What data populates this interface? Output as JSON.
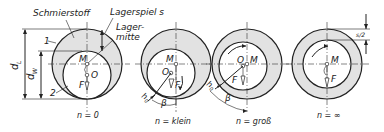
{
  "diagram": {
    "type": "plain-bearing-shaft-positions",
    "colors": {
      "lubricant": "#e2e2e2",
      "line": "#222222",
      "background": "#ffffff"
    },
    "labels": {
      "lubricant": "Schmierstoff",
      "clearance": "Lagerspiel s",
      "bearing_center": "Lager-\nmitte",
      "bearing_center_line1": "Lager-",
      "bearing_center_line2": "mitte",
      "d_bearing": "d",
      "d_bearing_sub": "L",
      "d_shaft": "d",
      "d_shaft_sub": "W",
      "part1": "1",
      "part2": "2",
      "half_clearance": "s/2"
    },
    "states": [
      {
        "caption": "n = 0",
        "M": "M",
        "O": "O",
        "F": "F"
      },
      {
        "caption": "n = klein",
        "M": "M",
        "O": "O",
        "F": "F",
        "h0": "h",
        "h0_sub": "0",
        "beta": "β"
      },
      {
        "caption": "n = groß",
        "M": "M",
        "O": "O",
        "F": "F",
        "h0": "h",
        "h0_sub": "0",
        "beta": "β"
      },
      {
        "caption": "n = ∞",
        "M": "M",
        "F": "F"
      }
    ]
  }
}
